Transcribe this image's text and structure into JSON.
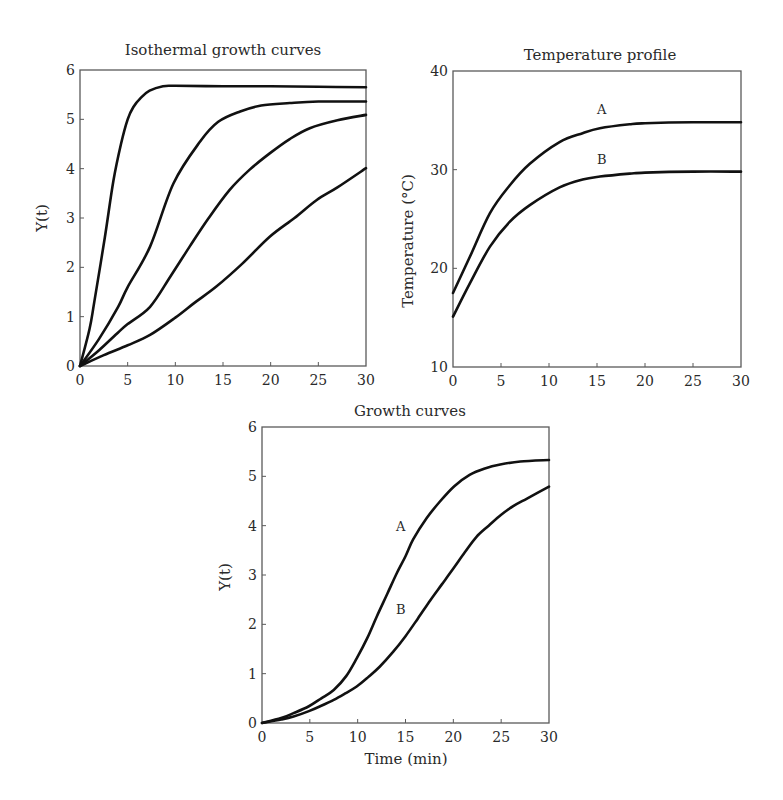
{
  "chart_data": [
    {
      "id": "isothermal",
      "type": "line",
      "title": "Isothermal growth curves",
      "xlabel": "",
      "ylabel": "Y(t)",
      "xlim": [
        0,
        30
      ],
      "ylim": [
        0,
        6
      ],
      "xticks": [
        0,
        5,
        10,
        15,
        20,
        25,
        30
      ],
      "yticks": [
        0,
        1,
        2,
        3,
        4,
        5,
        6
      ],
      "grid": false,
      "legend": null,
      "series": [
        {
          "name": "curve 1",
          "x": [
            0,
            1,
            1.5,
            2.6,
            3.5,
            4.3,
            5.0,
            5.6,
            6.4,
            7.3,
            8.7,
            10,
            15,
            20,
            25,
            30
          ],
          "y": [
            0,
            0.75,
            1.3,
            2.6,
            3.75,
            4.5,
            5.0,
            5.25,
            5.44,
            5.58,
            5.67,
            5.68,
            5.67,
            5.67,
            5.66,
            5.65
          ]
        },
        {
          "name": "curve 2",
          "x": [
            0,
            2,
            4,
            5,
            7.35,
            9.8,
            12.6,
            14.5,
            16.8,
            19,
            22,
            25,
            30
          ],
          "y": [
            0,
            0.55,
            1.2,
            1.6,
            2.42,
            3.7,
            4.55,
            4.95,
            5.16,
            5.28,
            5.33,
            5.36,
            5.36
          ]
        },
        {
          "name": "curve 3",
          "x": [
            0,
            2,
            4,
            5,
            7.35,
            9.5,
            11.5,
            13.5,
            15.7,
            17.8,
            19.9,
            22,
            24.1,
            27,
            30
          ],
          "y": [
            0,
            0.32,
            0.68,
            0.85,
            1.2,
            1.82,
            2.42,
            3.0,
            3.57,
            3.98,
            4.31,
            4.6,
            4.82,
            4.98,
            5.09
          ]
        },
        {
          "name": "curve 4",
          "x": [
            0,
            2.5,
            5,
            7.35,
            10,
            12,
            14.3,
            17,
            19.9,
            22.5,
            24.8,
            27,
            30
          ],
          "y": [
            0,
            0.22,
            0.42,
            0.63,
            0.98,
            1.28,
            1.61,
            2.07,
            2.62,
            3.0,
            3.36,
            3.62,
            4.01
          ]
        }
      ]
    },
    {
      "id": "temperature",
      "type": "line",
      "title": "Temperature profile",
      "xlabel": "",
      "ylabel": "Temperature (°C)",
      "xlim": [
        0,
        30
      ],
      "ylim": [
        10,
        40
      ],
      "xticks": [
        0,
        5,
        10,
        15,
        20,
        25,
        30
      ],
      "yticks": [
        10,
        20,
        30,
        40
      ],
      "grid": false,
      "legend": null,
      "annotations": [
        {
          "text": "A",
          "x": 15.5,
          "y": 35.6
        },
        {
          "text": "B",
          "x": 15.5,
          "y": 30.6
        }
      ],
      "series": [
        {
          "name": "A",
          "x": [
            0,
            1.77,
            3.85,
            5.9,
            8.0,
            11.1,
            13.5,
            15.3,
            18.4,
            20,
            25,
            30
          ],
          "y": [
            17.5,
            21.2,
            25.6,
            28.4,
            30.6,
            32.8,
            33.7,
            34.2,
            34.6,
            34.7,
            34.8,
            34.8
          ]
        },
        {
          "name": "B",
          "x": [
            0,
            1.77,
            3.85,
            5.9,
            8.0,
            11.1,
            13.5,
            15.3,
            18.4,
            20,
            25,
            30
          ],
          "y": [
            15.1,
            18.5,
            22.2,
            24.7,
            26.4,
            28.2,
            29.0,
            29.3,
            29.6,
            29.7,
            29.8,
            29.8
          ]
        }
      ]
    },
    {
      "id": "growth",
      "type": "line",
      "title": "Growth curves",
      "xlabel": "Time (min)",
      "ylabel": "Y(t)",
      "xlim": [
        0,
        30
      ],
      "ylim": [
        0,
        6
      ],
      "xticks": [
        0,
        5,
        10,
        15,
        20,
        25,
        30
      ],
      "yticks": [
        0,
        1,
        2,
        3,
        4,
        5,
        6
      ],
      "grid": false,
      "legend": null,
      "annotations": [
        {
          "text": "A",
          "x": 14.5,
          "y": 3.9
        },
        {
          "text": "B",
          "x": 14.5,
          "y": 2.2
        }
      ],
      "series": [
        {
          "name": "A",
          "x": [
            0,
            2,
            3.3,
            4.9,
            6.2,
            7.5,
            8.8,
            9.9,
            11,
            12.0,
            13.1,
            14.1,
            15.0,
            15.8,
            17.2,
            18.6,
            20.1,
            21.7,
            23.3,
            24.9,
            27,
            30
          ],
          "y": [
            0,
            0.1,
            0.2,
            0.34,
            0.5,
            0.67,
            0.95,
            1.31,
            1.72,
            2.16,
            2.62,
            3.04,
            3.38,
            3.72,
            4.15,
            4.49,
            4.8,
            5.03,
            5.16,
            5.24,
            5.3,
            5.33
          ]
        },
        {
          "name": "B",
          "x": [
            0,
            2,
            3.3,
            4.9,
            6.2,
            7.5,
            8.7,
            9.9,
            11.1,
            12.3,
            13.7,
            15.0,
            16.3,
            17.6,
            18.8,
            20.0,
            21.2,
            22.4,
            23.7,
            25.0,
            26.3,
            27.7,
            30
          ],
          "y": [
            0,
            0.07,
            0.13,
            0.24,
            0.35,
            0.47,
            0.6,
            0.74,
            0.93,
            1.14,
            1.44,
            1.76,
            2.12,
            2.49,
            2.81,
            3.13,
            3.46,
            3.77,
            4.0,
            4.22,
            4.4,
            4.55,
            4.79
          ]
        }
      ]
    }
  ],
  "panels": {
    "isothermal": {
      "title": "Isothermal growth curves",
      "ylabel": "Y(t)"
    },
    "temperature": {
      "title": "Temperature profile",
      "ylabel": "Temperature (°C)"
    },
    "growth": {
      "title": "Growth curves",
      "ylabel": "Y(t)",
      "xlabel": "Time (min)"
    }
  },
  "colors": {
    "curve": "#111111",
    "frame": "#5a5a5a",
    "text": "#2a2a2a",
    "background": "#ffffff"
  }
}
